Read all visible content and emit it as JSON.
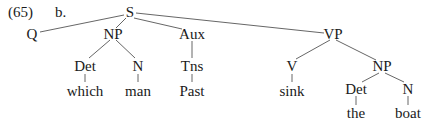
{
  "example": {
    "number": "(65)",
    "sub": "b."
  },
  "tree": {
    "root": "S",
    "nodes": [
      {
        "id": "S",
        "label": "S",
        "x": 130,
        "y": 12
      },
      {
        "id": "Q",
        "label": "Q",
        "x": 32,
        "y": 34
      },
      {
        "id": "NP1",
        "label": "NP",
        "x": 113,
        "y": 34
      },
      {
        "id": "Aux",
        "label": "Aux",
        "x": 192,
        "y": 34
      },
      {
        "id": "VP",
        "label": "VP",
        "x": 333,
        "y": 34
      },
      {
        "id": "Det1",
        "label": "Det",
        "x": 85,
        "y": 66
      },
      {
        "id": "N1",
        "label": "N",
        "x": 138,
        "y": 66
      },
      {
        "id": "Tns",
        "label": "Tns",
        "x": 192,
        "y": 66
      },
      {
        "id": "which",
        "label": "which",
        "x": 85,
        "y": 91
      },
      {
        "id": "man",
        "label": "man",
        "x": 138,
        "y": 91
      },
      {
        "id": "Past",
        "label": "Past",
        "x": 192,
        "y": 91
      },
      {
        "id": "V",
        "label": "V",
        "x": 292,
        "y": 66
      },
      {
        "id": "NP2",
        "label": "NP",
        "x": 382,
        "y": 66
      },
      {
        "id": "sink",
        "label": "sink",
        "x": 292,
        "y": 91
      },
      {
        "id": "Det2",
        "label": "Det",
        "x": 356,
        "y": 89
      },
      {
        "id": "N2",
        "label": "N",
        "x": 408,
        "y": 89
      },
      {
        "id": "the",
        "label": "the",
        "x": 356,
        "y": 113
      },
      {
        "id": "boat",
        "label": "boat",
        "x": 408,
        "y": 113
      }
    ],
    "edges": [
      [
        "S",
        "Q"
      ],
      [
        "S",
        "NP1"
      ],
      [
        "S",
        "Aux"
      ],
      [
        "S",
        "VP"
      ],
      [
        "NP1",
        "Det1"
      ],
      [
        "NP1",
        "N1"
      ],
      [
        "Aux",
        "Tns"
      ],
      [
        "Det1",
        "which"
      ],
      [
        "N1",
        "man"
      ],
      [
        "Tns",
        "Past"
      ],
      [
        "VP",
        "V"
      ],
      [
        "VP",
        "NP2"
      ],
      [
        "V",
        "sink"
      ],
      [
        "NP2",
        "Det2"
      ],
      [
        "NP2",
        "N2"
      ],
      [
        "Det2",
        "the"
      ],
      [
        "N2",
        "boat"
      ]
    ]
  }
}
